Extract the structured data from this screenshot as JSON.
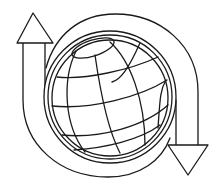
{
  "figure": {
    "title": "Globe with circular arrows",
    "icon": "global-exchange-icon"
  },
  "colors": {
    "background": "#ffffff",
    "line": "#1a1a1a",
    "fill": "#ffffff"
  },
  "elements": {
    "up_arrow": "arrow-up-icon",
    "down_arrow": "arrow-down-icon",
    "globe": "globe-icon"
  }
}
